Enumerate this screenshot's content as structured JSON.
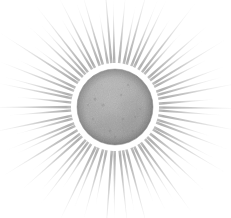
{
  "image": {
    "kind": "vintage-engraving-illustration",
    "subject": "sun",
    "title": "Sun with radiating rays",
    "alt_text": "Monochrome engraving-style illustration of a mottled gray sun disc surrounded by many fine radiating rays on a white background",
    "width": 231,
    "height": 218,
    "background_color": "#ffffff",
    "has_text": false,
    "has_border": false
  },
  "palette": {
    "background": "#ffffff",
    "disc_base": "#a4a4a4",
    "disc_mid": "#9b9b9b",
    "disc_light": "#b6b6b6",
    "disc_highlight": "#c2c2c2",
    "disc_rim": "#8e8e8e",
    "disc_rim_dark": "#868686",
    "ray_dark": "#878787",
    "ray_mid": "#9c9c9c",
    "ray_light": "#c4c4c4",
    "halo": "#ffffff"
  },
  "disc": {
    "name": "sun-disc",
    "center_x": 115,
    "center_y": 107,
    "radius": 38,
    "texture": "stippled-mottled-grain",
    "rim_shading": true,
    "halo_gap_px": 6
  },
  "rays": {
    "name": "sun-rays",
    "count": 68,
    "inner_radius": 44,
    "min_length": 54,
    "max_length": 96,
    "taper": "wide-at-base-pointed-at-tip",
    "base_width": 2.6,
    "opacity_base": 0.72,
    "opacity_tip": 0.0,
    "lengths": [
      92,
      66,
      84,
      58,
      78,
      70,
      88,
      62,
      80,
      56,
      90,
      68,
      74,
      60,
      86,
      64,
      82,
      72,
      94,
      58,
      76,
      66,
      88,
      54,
      80,
      70,
      84,
      62,
      92,
      68,
      74,
      60,
      86,
      64,
      90,
      56,
      78,
      72,
      82,
      66,
      94,
      58,
      76,
      68,
      88,
      62,
      84,
      70,
      80,
      54,
      92,
      66,
      74,
      60,
      86,
      72,
      78,
      64,
      90,
      56,
      82,
      68,
      88,
      62,
      76,
      70,
      84,
      58
    ],
    "angle_jitter": [
      0.6,
      -0.8,
      0.3,
      1.1,
      -0.5,
      0.9,
      -1.0,
      0.2,
      0.7,
      -0.6,
      1.0,
      -0.3,
      0.5,
      -0.9,
      0.8,
      0.1,
      -0.7,
      0.4,
      -1.1,
      0.6,
      -0.2,
      0.9,
      -0.5,
      1.0,
      0.3,
      -0.8,
      0.7,
      -0.4,
      0.2,
      1.1,
      -0.6,
      0.5,
      -1.0,
      0.8,
      -0.1,
      0.6,
      0.9,
      -0.7,
      0.3,
      -0.5,
      1.0,
      -0.3,
      0.7,
      0.2,
      -0.9,
      0.4,
      -0.6,
      0.8,
      -0.2,
      1.1,
      0.5,
      -1.0,
      0.1,
      0.9,
      -0.4,
      0.6,
      -0.8,
      0.3,
      0.7,
      -0.5,
      1.0,
      -0.1,
      0.4,
      -0.7,
      0.8,
      0.2,
      -0.3,
      0.9
    ]
  },
  "disc_blobs": [
    {
      "cx": -12,
      "cy": -14,
      "rx": 15,
      "ry": 11,
      "fill": "#b4b4b4",
      "opacity": 0.45,
      "rot": -22
    },
    {
      "cx": 10,
      "cy": -18,
      "rx": 12,
      "ry": 8,
      "fill": "#b9b9b9",
      "opacity": 0.4,
      "rot": 14
    },
    {
      "cx": 17,
      "cy": 4,
      "rx": 13,
      "ry": 10,
      "fill": "#989898",
      "opacity": 0.38,
      "rot": 36
    },
    {
      "cx": -6,
      "cy": 16,
      "rx": 16,
      "ry": 10,
      "fill": "#9a9a9a",
      "opacity": 0.34,
      "rot": -8
    },
    {
      "cx": -18,
      "cy": 6,
      "rx": 10,
      "ry": 13,
      "fill": "#adadad",
      "opacity": 0.42,
      "rot": 50
    },
    {
      "cx": 2,
      "cy": -4,
      "rx": 18,
      "ry": 13,
      "fill": "#aeaeae",
      "opacity": 0.3,
      "rot": 5
    },
    {
      "cx": 14,
      "cy": 19,
      "rx": 9,
      "ry": 7,
      "fill": "#949494",
      "opacity": 0.36,
      "rot": -30
    },
    {
      "cx": -15,
      "cy": 22,
      "rx": 11,
      "ry": 6,
      "fill": "#a0a0a0",
      "opacity": 0.32,
      "rot": 18
    },
    {
      "cx": 22,
      "cy": -6,
      "rx": 8,
      "ry": 11,
      "fill": "#a9a9a9",
      "opacity": 0.34,
      "rot": 62
    },
    {
      "cx": -3,
      "cy": -25,
      "rx": 14,
      "ry": 6,
      "fill": "#bdbdbd",
      "opacity": 0.38,
      "rot": -4
    }
  ],
  "disc_speckles": [
    {
      "cx": -20,
      "cy": -8,
      "r": 1.5,
      "fill": "#7f7f7f",
      "opacity": 0.4
    },
    {
      "cx": 8,
      "cy": 12,
      "r": 1.2,
      "fill": "#848484",
      "opacity": 0.42
    },
    {
      "cx": -5,
      "cy": 24,
      "r": 1.4,
      "fill": "#7c7c7c",
      "opacity": 0.36
    },
    {
      "cx": 20,
      "cy": 10,
      "r": 1.1,
      "fill": "#828282",
      "opacity": 0.44
    },
    {
      "cx": -22,
      "cy": 12,
      "r": 1.3,
      "fill": "#888888",
      "opacity": 0.34
    },
    {
      "cx": 13,
      "cy": -22,
      "r": 1.2,
      "fill": "#8b8b8b",
      "opacity": 0.38
    },
    {
      "cx": -12,
      "cy": -2,
      "r": 1.6,
      "fill": "#7a7a7a",
      "opacity": 0.3
    },
    {
      "cx": 25,
      "cy": 2,
      "r": 1.0,
      "fill": "#868686",
      "opacity": 0.4
    },
    {
      "cx": 0,
      "cy": 30,
      "r": 1.2,
      "fill": "#818181",
      "opacity": 0.32
    },
    {
      "cx": -27,
      "cy": -2,
      "r": 1.1,
      "fill": "#8d8d8d",
      "opacity": 0.36
    },
    {
      "cx": 6,
      "cy": -12,
      "r": 1.3,
      "fill": "#838383",
      "opacity": 0.34
    },
    {
      "cx": 18,
      "cy": 24,
      "r": 1.0,
      "fill": "#7e7e7e",
      "opacity": 0.38
    }
  ]
}
